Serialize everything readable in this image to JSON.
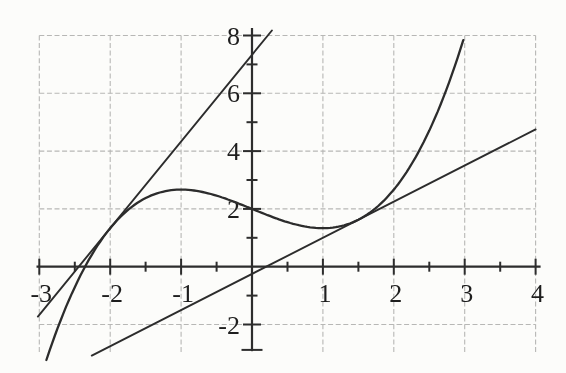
{
  "figure": {
    "background_color": "#fcfcfa",
    "grid_color": "#b7b7b5",
    "axis_color": "#2d2d2d",
    "curve_color": "#2c2c2c",
    "label_color": "#1e1e1e"
  },
  "chart_data": {
    "type": "line",
    "title": "",
    "xlabel": "",
    "ylabel": "",
    "x_axis": {
      "min": -3,
      "max": 4,
      "tick_label_values": [
        -3,
        -2,
        -1,
        1,
        2,
        3,
        4
      ],
      "tick_labels": [
        "-3",
        "-2",
        "-1",
        "1",
        "2",
        "3",
        "4"
      ],
      "minor_ticks": [
        -2.5,
        -1.5,
        -0.5,
        0.5,
        1.5,
        2.5,
        3.5
      ]
    },
    "y_axis": {
      "min": -2.9,
      "max": 8.3,
      "tick_label_values": [
        8,
        6,
        4,
        2,
        -2
      ],
      "tick_labels": [
        "8",
        "6",
        "4",
        "2",
        "-2"
      ],
      "major_ticks": [
        8,
        6,
        4,
        2,
        -2
      ],
      "minor_ticks": [
        7,
        5,
        3,
        1,
        -1
      ],
      "axis_end_tick": -2.88
    },
    "grid": {
      "x_lines": [
        -3,
        -2,
        -1,
        0,
        1,
        2,
        3,
        4
      ],
      "y_lines": [
        8,
        6,
        4,
        2,
        -2
      ],
      "dashed": true
    },
    "series": [
      {
        "name": "cubic-curve",
        "label": "f(x) = x^3/3 - x + 2",
        "kind": "cubic",
        "coefficients": [
          0.3333333,
          0,
          -1,
          2
        ],
        "x_range": [
          -2.9,
          3.01
        ]
      },
      {
        "name": "steep-tangent-line",
        "label": "y = 3x + 22/3, tangent to curve at x = -2",
        "kind": "linear",
        "slope": 3,
        "intercept": 7.3333,
        "x_range": [
          -3.02,
          0.28
        ]
      },
      {
        "name": "shallow-tangent-line",
        "label": "y = 1.25x - 0.25, tangent to curve at x = 1.5",
        "kind": "linear",
        "slope": 1.25,
        "intercept": -0.25,
        "x_range": [
          -2.26,
          4.0
        ]
      }
    ],
    "key_points": {
      "curve_y_intercept": [
        0,
        2
      ],
      "curve_x_intercept": [
        -2.36,
        0
      ],
      "local_max": [
        -1,
        2.667
      ],
      "local_min": [
        1,
        1.333
      ],
      "tangency_points": [
        [
          -2,
          1.333
        ],
        [
          1.5,
          1.625
        ]
      ]
    },
    "layout": {
      "origin_px": [
        252,
        266.7
      ],
      "px_per_unit_x": 70.9,
      "px_per_unit_y": 28.9,
      "grid_y_extent": [
        -2.95,
        8.05
      ],
      "x_axis_extent": [
        -3.04,
        4.07
      ],
      "y_axis_extent": [
        -2.92,
        8.26
      ]
    }
  }
}
